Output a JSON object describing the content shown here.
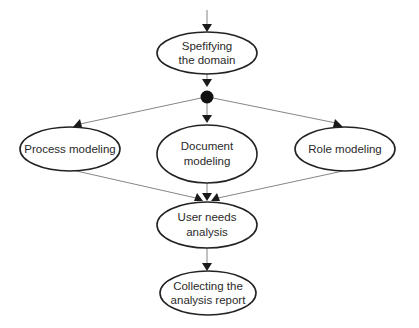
{
  "diagram": {
    "type": "activity-flow",
    "colors": {
      "node_stroke": "#222222",
      "edge": "#777777",
      "arrowhead": "#1a1a1a",
      "fork": "#111111",
      "text": "#2a2a2a",
      "background": "#ffffff"
    },
    "nodes": [
      {
        "id": "specifying",
        "lines": [
          "Spefifying",
          "the domain"
        ]
      },
      {
        "id": "fork",
        "kind": "fork-dot"
      },
      {
        "id": "process",
        "lines": [
          "Process modeling"
        ]
      },
      {
        "id": "document",
        "lines": [
          "Document",
          "modeling"
        ]
      },
      {
        "id": "role",
        "lines": [
          "Role modeling"
        ]
      },
      {
        "id": "user_needs",
        "lines": [
          "User needs",
          "analysis"
        ]
      },
      {
        "id": "collecting",
        "lines": [
          "Collecting the",
          "analysis report"
        ]
      }
    ],
    "edges": [
      {
        "from": "start",
        "to": "specifying"
      },
      {
        "from": "specifying",
        "to": "fork"
      },
      {
        "from": "fork",
        "to": "process"
      },
      {
        "from": "fork",
        "to": "document"
      },
      {
        "from": "fork",
        "to": "role"
      },
      {
        "from": "process",
        "to": "user_needs"
      },
      {
        "from": "document",
        "to": "user_needs"
      },
      {
        "from": "role",
        "to": "user_needs"
      },
      {
        "from": "user_needs",
        "to": "collecting"
      }
    ]
  }
}
